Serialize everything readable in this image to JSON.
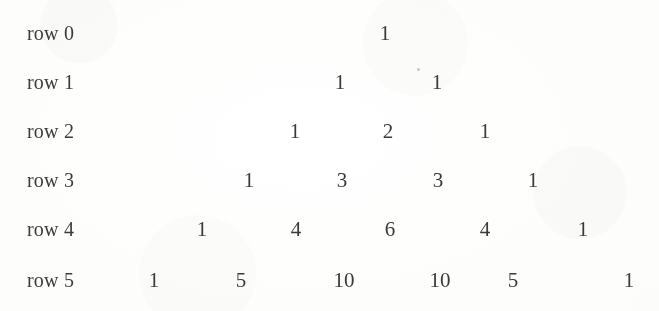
{
  "page": {
    "background_color": "#fdfdfb",
    "text_color": "#3a3a3a"
  },
  "triangle": {
    "title": "Pascal's Triangle rows 0 through 5",
    "row_label_prefix": "row",
    "rows": [
      {
        "label": "row 0",
        "y": 18,
        "values": [
          "1"
        ],
        "x": [
          385
        ]
      },
      {
        "label": "row 1",
        "y": 67,
        "values": [
          "1",
          "1"
        ],
        "x": [
          340,
          437
        ]
      },
      {
        "label": "row 2",
        "y": 116,
        "values": [
          "1",
          "2",
          "1"
        ],
        "x": [
          295,
          388,
          485
        ]
      },
      {
        "label": "row 3",
        "y": 165,
        "values": [
          "1",
          "3",
          "3",
          "1"
        ],
        "x": [
          249,
          342,
          438,
          533
        ]
      },
      {
        "label": "row 4",
        "y": 214,
        "values": [
          "1",
          "4",
          "6",
          "4",
          "1"
        ],
        "x": [
          202,
          296,
          390,
          485,
          583
        ]
      },
      {
        "label": "row 5",
        "y": 265,
        "values": [
          "1",
          "5",
          "10",
          "10",
          "5",
          "1"
        ],
        "x": [
          154,
          241,
          344,
          440,
          513,
          629
        ]
      }
    ]
  },
  "artifacts": {
    "specks": [
      {
        "x": 417,
        "y": 68
      }
    ]
  },
  "chart_data": {
    "type": "table",
    "row_labels": [
      "row 0",
      "row 1",
      "row 2",
      "row 3",
      "row 4",
      "row 5"
    ],
    "values": [
      [
        1
      ],
      [
        1,
        1
      ],
      [
        1,
        2,
        1
      ],
      [
        1,
        3,
        3,
        1
      ],
      [
        1,
        4,
        6,
        4,
        1
      ],
      [
        1,
        5,
        10,
        10,
        5,
        1
      ]
    ],
    "xlabel": "",
    "ylabel": "",
    "grid": false,
    "legend": "none"
  }
}
